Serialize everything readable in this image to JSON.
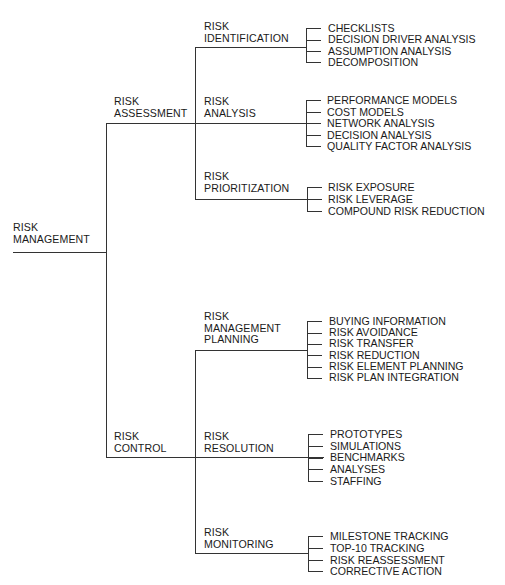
{
  "diagram": {
    "root": {
      "line1": "RISK",
      "line2": "MANAGEMENT"
    },
    "branches": [
      {
        "line1": "RISK",
        "line2": "ASSESSMENT",
        "children": [
          {
            "line1": "RISK",
            "line2": "IDENTIFICATION",
            "items": [
              "CHECKLISTS",
              "DECISION DRIVER ANALYSIS",
              "ASSUMPTION ANALYSIS",
              "DECOMPOSITION"
            ]
          },
          {
            "line1": "RISK",
            "line2": "ANALYSIS",
            "items": [
              "PERFORMANCE MODELS",
              "COST MODELS",
              "NETWORK ANALYSIS",
              "DECISION ANALYSIS",
              "QUALITY FACTOR ANALYSIS"
            ]
          },
          {
            "line1": "RISK",
            "line2": "PRIORITIZATION",
            "items": [
              "RISK EXPOSURE",
              "RISK LEVERAGE",
              "COMPOUND RISK REDUCTION"
            ]
          }
        ]
      },
      {
        "line1": "RISK",
        "line2": "CONTROL",
        "children": [
          {
            "line1": "RISK",
            "line2": "MANAGEMENT",
            "line3": "PLANNING",
            "items": [
              "BUYING INFORMATION",
              "RISK AVOIDANCE",
              "RISK TRANSFER",
              "RISK REDUCTION",
              "RISK ELEMENT PLANNING",
              "RISK PLAN INTEGRATION"
            ]
          },
          {
            "line1": "RISK",
            "line2": "RESOLUTION",
            "items": [
              "PROTOTYPES",
              "SIMULATIONS",
              "BENCHMARKS",
              "ANALYSES",
              "STAFFING"
            ]
          },
          {
            "line1": "RISK",
            "line2": "MONITORING",
            "items": [
              "MILESTONE TRACKING",
              "TOP-10 TRACKING",
              "RISK REASSESSMENT",
              "CORRECTIVE ACTION"
            ]
          }
        ]
      }
    ],
    "colors": {
      "line": "#333333",
      "text": "#1a1a1a",
      "background": "#ffffff"
    }
  }
}
